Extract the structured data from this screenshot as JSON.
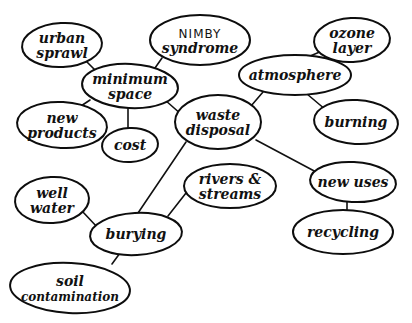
{
  "diagram": {
    "type": "concept-map",
    "style": "hand-drawn",
    "colors": {
      "ink": "#111111",
      "background": "#ffffff"
    },
    "nodes": [
      {
        "id": "urban_sprawl",
        "lines": [
          "urban",
          "sprawl"
        ],
        "cx": 62,
        "cy": 45,
        "rx": 40,
        "ry": 22
      },
      {
        "id": "nimby",
        "lines": [
          "NIMBY",
          "syndrome"
        ],
        "cx": 200,
        "cy": 40,
        "rx": 50,
        "ry": 25
      },
      {
        "id": "minimum_space",
        "lines": [
          "minimum",
          "space"
        ],
        "cx": 130,
        "cy": 86,
        "rx": 48,
        "ry": 22
      },
      {
        "id": "ozone_layer",
        "lines": [
          "ozone",
          "layer"
        ],
        "cx": 352,
        "cy": 40,
        "rx": 38,
        "ry": 22
      },
      {
        "id": "atmosphere",
        "lines": [
          "atmosphere"
        ],
        "cx": 295,
        "cy": 75,
        "rx": 56,
        "ry": 20
      },
      {
        "id": "new_products",
        "lines": [
          "new",
          "products"
        ],
        "cx": 62,
        "cy": 125,
        "rx": 45,
        "ry": 23
      },
      {
        "id": "cost",
        "lines": [
          "cost"
        ],
        "cx": 130,
        "cy": 145,
        "rx": 28,
        "ry": 17
      },
      {
        "id": "waste_disposal",
        "lines": [
          "waste",
          "disposal"
        ],
        "cx": 218,
        "cy": 122,
        "rx": 43,
        "ry": 27
      },
      {
        "id": "burning",
        "lines": [
          "burning"
        ],
        "cx": 356,
        "cy": 122,
        "rx": 42,
        "ry": 22
      },
      {
        "id": "well_water",
        "lines": [
          "well",
          "water"
        ],
        "cx": 52,
        "cy": 200,
        "rx": 37,
        "ry": 23
      },
      {
        "id": "rivers_streams",
        "lines": [
          "rivers &",
          "streams"
        ],
        "cx": 230,
        "cy": 186,
        "rx": 46,
        "ry": 22
      },
      {
        "id": "new_uses",
        "lines": [
          "new uses"
        ],
        "cx": 353,
        "cy": 182,
        "rx": 43,
        "ry": 20
      },
      {
        "id": "burying",
        "lines": [
          "burying"
        ],
        "cx": 136,
        "cy": 234,
        "rx": 46,
        "ry": 21
      },
      {
        "id": "recycling",
        "lines": [
          "recycling"
        ],
        "cx": 343,
        "cy": 232,
        "rx": 50,
        "ry": 22
      },
      {
        "id": "soil_contamination",
        "lines": [
          "soil",
          "contamination"
        ],
        "cx": 70,
        "cy": 288,
        "rx": 60,
        "ry": 25
      }
    ],
    "edges": [
      {
        "from": "urban_sprawl",
        "to": "minimum_space",
        "x1": 86,
        "y1": 61,
        "x2": 98,
        "y2": 73
      },
      {
        "from": "nimby",
        "to": "minimum_space",
        "x1": 162,
        "y1": 58,
        "x2": 155,
        "y2": 68
      },
      {
        "from": "minimum_space",
        "to": "new_products",
        "x1": 90,
        "y1": 100,
        "x2": 78,
        "y2": 108
      },
      {
        "from": "minimum_space",
        "to": "cost",
        "x1": 128,
        "y1": 108,
        "x2": 128,
        "y2": 128
      },
      {
        "from": "minimum_space",
        "to": "waste_disposal",
        "x1": 165,
        "y1": 100,
        "x2": 182,
        "y2": 115
      },
      {
        "from": "ozone_layer",
        "to": "atmosphere",
        "x1": 322,
        "y1": 51,
        "x2": 296,
        "y2": 62
      },
      {
        "from": "atmosphere",
        "to": "waste_disposal",
        "x1": 263,
        "y1": 92,
        "x2": 251,
        "y2": 106
      },
      {
        "from": "atmosphere",
        "to": "burning",
        "x1": 307,
        "y1": 94,
        "x2": 326,
        "y2": 110
      },
      {
        "from": "waste_disposal",
        "to": "new_uses",
        "x1": 256,
        "y1": 140,
        "x2": 318,
        "y2": 173
      },
      {
        "from": "waste_disposal",
        "to": "burying",
        "x1": 186,
        "y1": 142,
        "x2": 138,
        "y2": 213
      },
      {
        "from": "rivers_streams",
        "to": "burying",
        "x1": 186,
        "y1": 193,
        "x2": 168,
        "y2": 216
      },
      {
        "from": "well_water",
        "to": "burying",
        "x1": 82,
        "y1": 211,
        "x2": 98,
        "y2": 228
      },
      {
        "from": "burying",
        "to": "soil_contamination",
        "x1": 120,
        "y1": 253,
        "x2": 112,
        "y2": 264
      },
      {
        "from": "new_uses",
        "to": "recycling",
        "x1": 347,
        "y1": 202,
        "x2": 347,
        "y2": 212
      }
    ]
  }
}
